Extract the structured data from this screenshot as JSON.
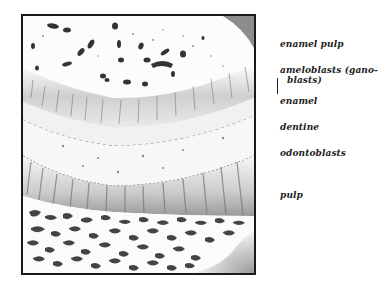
{
  "figure": {
    "frame_color": "#1a1a1a",
    "layer_colors": {
      "enamel_pulp_bg": "#fbfbfb",
      "cell_dark": "#3a3a3a",
      "ameloblast_band": "#d8d8d8",
      "enamel_band": "#eeeeee",
      "dentine_band": "#f4f4f4",
      "odontoblast_band": "#cfcfcf",
      "pulp_cells": "#4a4a4a"
    }
  },
  "labels": [
    {
      "id": "enamel-pulp",
      "text": "enamel pulp"
    },
    {
      "id": "ameloblasts",
      "text": "ameloblasts (gano-"
    },
    {
      "id": "ameloblasts-cont",
      "text": "blasts)"
    },
    {
      "id": "enamel",
      "text": "enamel"
    },
    {
      "id": "dentine",
      "text": "dentine"
    },
    {
      "id": "odontoblasts",
      "text": "odontoblasts"
    },
    {
      "id": "pulp",
      "text": "pulp"
    }
  ]
}
